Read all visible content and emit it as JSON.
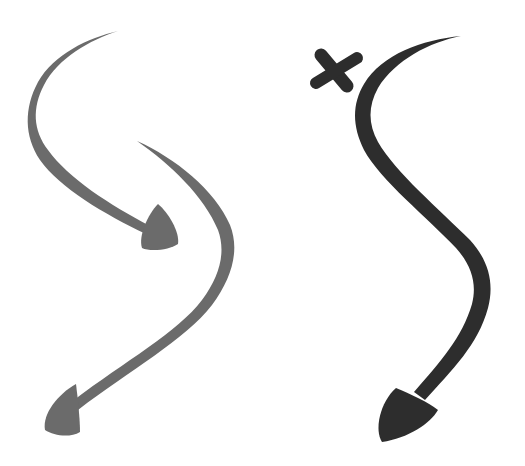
{
  "image": {
    "description": "Hand-drawn brush-stroke arrows on white background",
    "background": "#ffffff"
  },
  "arrows": [
    {
      "name": "gray-arrow-top",
      "color": "#6b6b6b",
      "direction": "down-right"
    },
    {
      "name": "gray-arrow-bottom",
      "color": "#6b6b6b",
      "direction": "down-left"
    },
    {
      "name": "dark-arrow",
      "color": "#2d2d2d",
      "direction": "down-left"
    }
  ],
  "marks": [
    {
      "name": "x-mark",
      "color": "#2d2d2d",
      "glyph": "×"
    }
  ]
}
